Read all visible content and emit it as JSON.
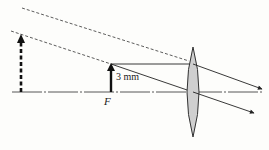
{
  "diagram": {
    "title": "",
    "labels": {
      "object_height": "3 mm",
      "focal_point": "F"
    },
    "elements": {
      "optical_axis": "dash-dot horizontal line",
      "lens": "converging (biconvex) lens",
      "object_arrow": "solid arrow at focal point F",
      "virtual_image_arrow": "dashed arrow (virtual image)",
      "rays": [
        "parallel ray from object tip refracts through focal point on far side",
        "ray through lens center continues undeviated",
        "dashed back-extensions toward virtual image"
      ]
    },
    "colors": {
      "background": "#fdfdfb",
      "ink": "#222222",
      "lens_fill": "#cfcfcf"
    }
  }
}
